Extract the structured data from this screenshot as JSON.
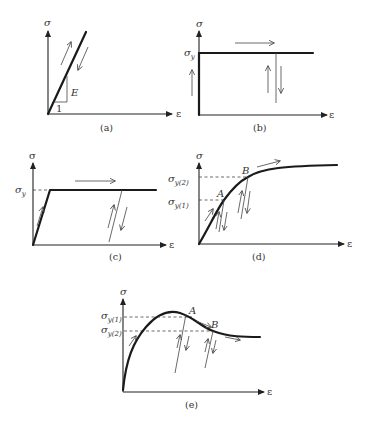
{
  "figure": {
    "axis_labels": {
      "y": "σ",
      "x": "ε"
    },
    "panels": {
      "a": {
        "caption": "(a)",
        "slope_label": "E",
        "run_label": "1"
      },
      "b": {
        "caption": "(b)",
        "yield_label": "σ",
        "yield_sub": "y"
      },
      "c": {
        "caption": "(c)",
        "yield_label": "σ",
        "yield_sub": "y"
      },
      "d": {
        "caption": "(d)",
        "yield1_label": "σ",
        "yield1_sub": "y(1)",
        "yield2_label": "σ",
        "yield2_sub": "y(2)",
        "point_a": "A",
        "point_b": "B"
      },
      "e": {
        "caption": "(e)",
        "yield1_label": "σ",
        "yield1_sub": "y(1)",
        "yield2_label": "σ",
        "yield2_sub": "y(2)",
        "point_a": "A",
        "point_b": "B"
      }
    }
  }
}
